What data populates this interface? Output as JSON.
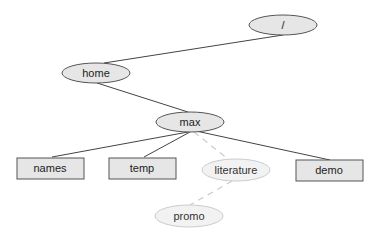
{
  "diagram": {
    "type": "directory-tree",
    "nodes": [
      {
        "id": "root",
        "label": "/",
        "shape": "ellipse",
        "style": "solid"
      },
      {
        "id": "home",
        "label": "home",
        "shape": "ellipse",
        "style": "solid"
      },
      {
        "id": "max",
        "label": "max",
        "shape": "ellipse",
        "style": "solid"
      },
      {
        "id": "names",
        "label": "names",
        "shape": "rect",
        "style": "solid"
      },
      {
        "id": "temp",
        "label": "temp",
        "shape": "rect",
        "style": "solid"
      },
      {
        "id": "literature",
        "label": "literature",
        "shape": "ellipse",
        "style": "faded"
      },
      {
        "id": "demo",
        "label": "demo",
        "shape": "rect",
        "style": "solid"
      },
      {
        "id": "promo",
        "label": "promo",
        "shape": "ellipse",
        "style": "faded"
      }
    ],
    "edges": [
      {
        "from": "root",
        "to": "home",
        "style": "solid"
      },
      {
        "from": "home",
        "to": "max",
        "style": "solid"
      },
      {
        "from": "max",
        "to": "names",
        "style": "solid"
      },
      {
        "from": "max",
        "to": "temp",
        "style": "solid"
      },
      {
        "from": "max",
        "to": "literature",
        "style": "dashed"
      },
      {
        "from": "max",
        "to": "demo",
        "style": "solid"
      },
      {
        "from": "literature",
        "to": "promo",
        "style": "dashed"
      }
    ],
    "colors": {
      "node_fill": "#e6e6e6",
      "node_stroke": "#555555",
      "faded_fill": "#f2f2f2",
      "faded_stroke": "#cccccc",
      "edge": "#444444",
      "dashed_edge": "#cccccc"
    }
  }
}
